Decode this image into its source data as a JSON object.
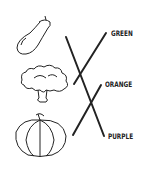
{
  "worksheet": {
    "pictures": [
      {
        "name": "eggplant"
      },
      {
        "name": "broccoli"
      },
      {
        "name": "pumpkin"
      }
    ],
    "labels": [
      "GREEN",
      "ORANGE",
      "PURPLE"
    ],
    "matches": [
      {
        "picture": "eggplant",
        "label": "PURPLE"
      },
      {
        "picture": "broccoli",
        "label": "GREEN"
      },
      {
        "picture": "pumpkin",
        "label": "ORANGE"
      }
    ],
    "line_color": "#222222"
  }
}
